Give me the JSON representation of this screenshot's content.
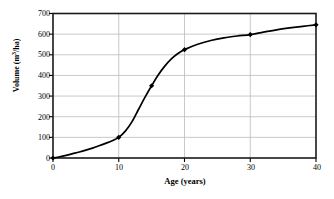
{
  "chart_data": {
    "type": "line",
    "title": "",
    "xlabel": "Age (years)",
    "ylabel_parts": {
      "pre": "Volume (m",
      "sup": "3",
      "post": "/ha)"
    },
    "ylabel": "Volume (m3/ha)",
    "xlim": [
      0,
      40
    ],
    "ylim": [
      0,
      700
    ],
    "xticks": [
      0,
      10,
      20,
      30,
      40
    ],
    "xtick_labels": [
      "0",
      "10",
      "20",
      "30",
      "40"
    ],
    "yticks": [
      0,
      100,
      200,
      300,
      400,
      500,
      600,
      700
    ],
    "ytick_labels": [
      "0",
      "100",
      "200",
      "300",
      "400",
      "500",
      "600",
      "700"
    ],
    "grid": {
      "horizontal": true,
      "vertical": true,
      "color": "#bbbbbb"
    },
    "legend": null,
    "series": [
      {
        "name": "Stand volume",
        "marker": "diamond",
        "marker_color": "#000000",
        "line_color": "#000000",
        "x": [
          0,
          10,
          15,
          20,
          30,
          40
        ],
        "values": [
          0,
          100,
          350,
          525,
          598,
          645
        ]
      }
    ],
    "curve_points": [
      [
        0,
        0
      ],
      [
        1,
        6
      ],
      [
        2,
        13
      ],
      [
        3,
        21
      ],
      [
        4,
        29
      ],
      [
        5,
        38
      ],
      [
        6,
        48
      ],
      [
        7,
        59
      ],
      [
        8,
        71
      ],
      [
        9,
        84
      ],
      [
        10,
        100
      ],
      [
        11,
        130
      ],
      [
        12,
        175
      ],
      [
        13,
        235
      ],
      [
        14,
        295
      ],
      [
        15,
        350
      ],
      [
        16,
        402
      ],
      [
        17,
        445
      ],
      [
        18,
        480
      ],
      [
        19,
        506
      ],
      [
        20,
        525
      ],
      [
        22,
        551
      ],
      [
        24,
        569
      ],
      [
        26,
        582
      ],
      [
        28,
        591
      ],
      [
        30,
        598
      ],
      [
        32,
        610
      ],
      [
        34,
        621
      ],
      [
        36,
        630
      ],
      [
        38,
        638
      ],
      [
        40,
        645
      ]
    ],
    "axis_color": "#000000",
    "background": "#ffffff"
  }
}
